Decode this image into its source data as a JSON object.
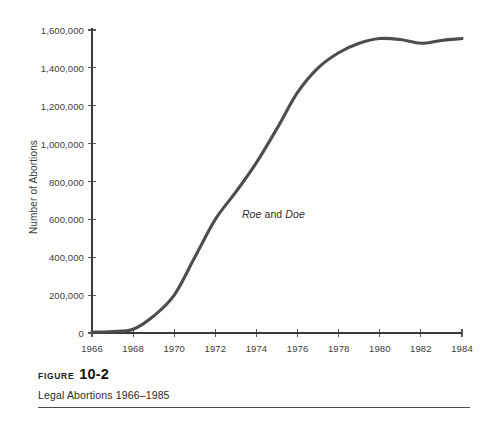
{
  "figure": {
    "label_word": "FIGURE",
    "number": "10-2",
    "caption": "Legal Abortions 1966–1985"
  },
  "annotation": {
    "case_one": "Roe",
    "conjunction": " and ",
    "case_two": "Doe"
  },
  "chart_data": {
    "type": "line",
    "title": "Legal Abortions 1966–1985",
    "xlabel": "",
    "ylabel": "Number of Abortions",
    "xlim": [
      1966,
      1984
    ],
    "ylim": [
      0,
      1600000
    ],
    "grid": false,
    "legend": "none",
    "xticks": [
      1966,
      1968,
      1970,
      1972,
      1974,
      1976,
      1978,
      1980,
      1982,
      1984
    ],
    "xtick_labels": [
      "1966",
      "1968",
      "1970",
      "1972",
      "1974",
      "1976",
      "1978",
      "1980",
      "1982",
      "1984"
    ],
    "yticks": [
      0,
      200000,
      400000,
      600000,
      800000,
      1000000,
      1200000,
      1400000,
      1600000
    ],
    "ytick_labels": [
      "0",
      "200,000",
      "400,000",
      "600,000",
      "800,000",
      "1,000,000",
      "1,200,000",
      "1,400,000",
      "1,600,000"
    ],
    "line_color": "#4d4d4d",
    "axis_color": "#3a3a3a",
    "annotations": [
      {
        "text": "Roe and Doe",
        "x": 1973,
        "y": 620000
      }
    ],
    "x": [
      1966,
      1967,
      1968,
      1969,
      1970,
      1971,
      1972,
      1973,
      1974,
      1975,
      1976,
      1977,
      1978,
      1979,
      1980,
      1981,
      1982,
      1983,
      1984
    ],
    "values": [
      5000,
      8000,
      20000,
      90000,
      200000,
      400000,
      600000,
      745000,
      900000,
      1080000,
      1270000,
      1400000,
      1480000,
      1530000,
      1555000,
      1550000,
      1530000,
      1545000,
      1555000
    ],
    "series": [
      {
        "name": "Number of Abortions",
        "values": [
          5000,
          8000,
          20000,
          90000,
          200000,
          400000,
          600000,
          745000,
          900000,
          1080000,
          1270000,
          1400000,
          1480000,
          1530000,
          1555000,
          1550000,
          1530000,
          1545000,
          1555000
        ]
      }
    ]
  }
}
